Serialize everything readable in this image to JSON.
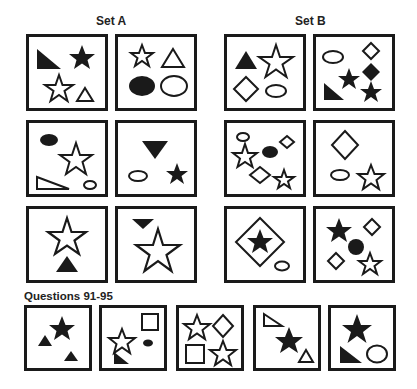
{
  "set_a": {
    "title": "Set A",
    "panels": [
      {
        "shapes": [
          "filled right triangle",
          "filled star",
          "outline star",
          "outline triangle"
        ]
      },
      {
        "shapes": [
          "outline star",
          "outline triangle",
          "filled ellipse",
          "outline ellipse"
        ]
      },
      {
        "shapes": [
          "filled ellipse",
          "outline star",
          "outline right triangle",
          "outline small ellipse"
        ]
      },
      {
        "shapes": [
          "filled inverted triangle",
          "outline ellipse",
          "filled star"
        ]
      },
      {
        "shapes": [
          "outline star",
          "filled triangle"
        ]
      },
      {
        "shapes": [
          "filled inverted triangle",
          "outline star"
        ]
      }
    ]
  },
  "set_b": {
    "title": "Set B",
    "panels": [
      {
        "shapes": [
          "filled triangle",
          "outline star",
          "outline diamond",
          "outline ellipse"
        ]
      },
      {
        "shapes": [
          "outline ellipse",
          "outline diamond",
          "filled diamond",
          "filled star",
          "filled right triangle",
          "filled star"
        ]
      },
      {
        "shapes": [
          "outline ellipse",
          "outline star",
          "filled ellipse",
          "outline diamond",
          "outline diamond",
          "outline star"
        ]
      },
      {
        "shapes": [
          "outline diamond",
          "outline ellipse",
          "outline star"
        ]
      },
      {
        "shapes": [
          "outline diamond enclosing filled star",
          "outline small ellipse"
        ]
      },
      {
        "shapes": [
          "filled star",
          "outline diamond",
          "filled circle",
          "outline diamond",
          "outline star"
        ]
      }
    ]
  },
  "questions": {
    "title": "Questions 91-95",
    "panels": [
      {
        "number": 91,
        "shapes": [
          "filled star",
          "filled triangle",
          "filled triangle"
        ]
      },
      {
        "number": 92,
        "shapes": [
          "outline square",
          "outline star",
          "filled ellipse",
          "filled right triangle"
        ]
      },
      {
        "number": 93,
        "shapes": [
          "outline star",
          "outline diamond",
          "outline square",
          "outline star"
        ]
      },
      {
        "number": 94,
        "shapes": [
          "outline right triangle",
          "filled star",
          "outline triangle"
        ]
      },
      {
        "number": 95,
        "shapes": [
          "filled star",
          "filled right triangle",
          "outline ellipse"
        ]
      }
    ]
  },
  "colors": {
    "ink": "#1a1a1a",
    "background": "#ffffff"
  }
}
